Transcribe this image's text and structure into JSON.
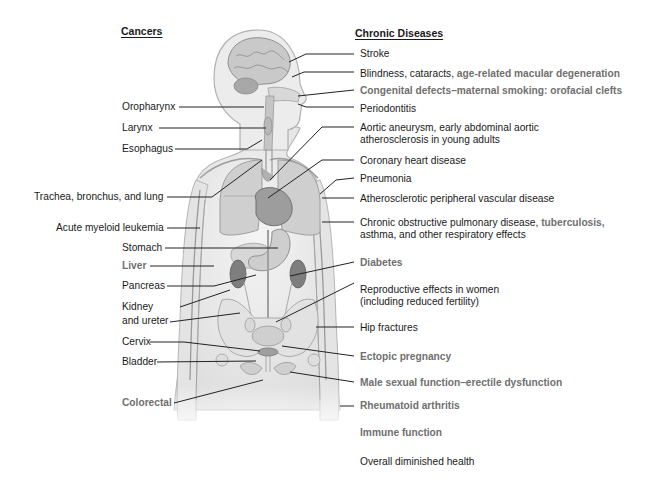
{
  "headers": {
    "cancers": "Cancers",
    "chronic": "Chronic Diseases"
  },
  "colors": {
    "black_text": "#1a1a1a",
    "gray_text": "#6f6f6f",
    "leader_line": "#222222",
    "body_fill": "#e9e9e9",
    "organ_fill": "#bdbdbd"
  },
  "cancers": [
    {
      "label": "Oropharynx",
      "gray": false
    },
    {
      "label": "Larynx",
      "gray": false
    },
    {
      "label": "Esophagus",
      "gray": false
    },
    {
      "label": "Trachea, bronchus, and lung",
      "gray": false
    },
    {
      "label": "Acute myeloid leukemia",
      "gray": false
    },
    {
      "label": "Stomach",
      "gray": false
    },
    {
      "label": "Liver",
      "gray": true
    },
    {
      "label": "Pancreas",
      "gray": false
    },
    {
      "label": "Kidney",
      "gray": false
    },
    {
      "label": "and ureter",
      "gray": false
    },
    {
      "label": "Cervix",
      "gray": false
    },
    {
      "label": "Bladder",
      "gray": false
    },
    {
      "label": "Colorectal",
      "gray": true
    }
  ],
  "chronic": {
    "stroke": "Stroke",
    "blindness_a": "Blindness, cataracts, ",
    "blindness_b": "age-related macular degeneration",
    "congenital": "Congenital defects–maternal smoking: orofacial clefts",
    "periodontitis": "Periodontitis",
    "aortic_1": "Aortic aneurysm, early abdominal aortic",
    "aortic_2": "atherosclerosis in young adults",
    "coronary": "Coronary heart disease",
    "pneumonia": "Pneumonia",
    "atherosclerotic": "Atherosclerotic peripheral vascular disease",
    "copd_1a": "Chronic obstructive pulmonary disease, ",
    "copd_1b": "tuberculosis,",
    "copd_2": "asthma, and other respiratory effects",
    "diabetes": "Diabetes",
    "reproductive_1": "Reproductive effects in women",
    "reproductive_2": "(including reduced fertility)",
    "hip": "Hip fractures",
    "ectopic": "Ectopic pregnancy",
    "male": "Male sexual function–erectile dysfunction",
    "rheumatoid": "Rheumatoid arthritis",
    "immune": "Immune function",
    "overall": "Overall diminished health"
  }
}
